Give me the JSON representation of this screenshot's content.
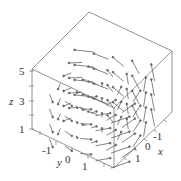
{
  "chart_data": {
    "type": "vector_field_3d",
    "title": "",
    "axes": {
      "x": {
        "label": "x",
        "ticks": [
          "-1",
          "0",
          "1"
        ],
        "range": [
          -2,
          2
        ]
      },
      "y": {
        "label": "y",
        "ticks": [
          "-1",
          "0",
          "1"
        ],
        "range": [
          -2,
          2
        ]
      },
      "z": {
        "label": "z",
        "ticks": [
          "1",
          "3",
          "5"
        ],
        "range": [
          1,
          5
        ]
      }
    },
    "grid": false,
    "legend": null
  },
  "labels": {
    "z_axis": "z",
    "y_axis": "y",
    "x_axis": "x",
    "z_ticks": [
      "5",
      "3",
      "1"
    ],
    "y_ticks": [
      "-1",
      "0",
      "1"
    ],
    "x_ticks": [
      "-1",
      "0",
      "1"
    ]
  },
  "colors": {
    "box": "#777777",
    "arrow": "#666666",
    "text": "#333333"
  }
}
